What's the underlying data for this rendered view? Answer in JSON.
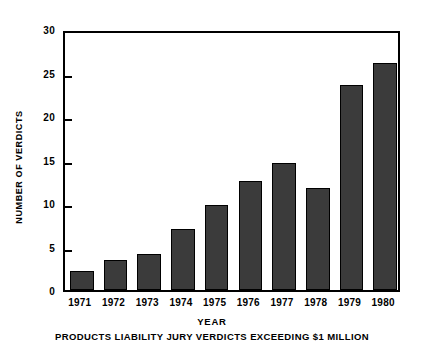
{
  "chart_data": {
    "type": "bar",
    "title": "",
    "xlabel": "YEAR",
    "ylabel": "NUMBER OF VERDICTS",
    "caption": "PRODUCTS LIABILITY JURY VERDICTS EXCEEDING $1 MILLION",
    "categories": [
      "1971",
      "1972",
      "1973",
      "1974",
      "1975",
      "1976",
      "1977",
      "1978",
      "1979",
      "1980"
    ],
    "values": [
      2.2,
      3.5,
      4.1,
      7.0,
      9.8,
      12.5,
      14.6,
      11.7,
      23.6,
      26.1
    ],
    "ylim": [
      0,
      30
    ],
    "yticks": [
      0,
      5,
      10,
      15,
      20,
      25,
      30
    ],
    "ytick_labels": [
      "0",
      "5",
      "10",
      "15",
      "20",
      "25",
      "30"
    ],
    "grid": false,
    "legend": false,
    "bar_color": "#3b3b3b",
    "bar_edge_color": "#000000",
    "axis_color": "#000000",
    "background_color": "#ffffff"
  }
}
